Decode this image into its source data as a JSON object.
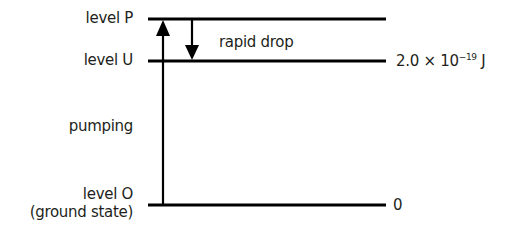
{
  "diagram": {
    "type": "energy-level-diagram",
    "levels": [
      {
        "id": "P",
        "label": "level P",
        "energy_label": ""
      },
      {
        "id": "U",
        "label": "level U",
        "energy_label": "2.0 × 10⁻¹⁹ J"
      },
      {
        "id": "O",
        "label": "level O",
        "sublabel": "(ground state)",
        "energy_label": "0"
      }
    ],
    "transitions": [
      {
        "from": "O",
        "to": "P",
        "label": "pumping",
        "direction": "up"
      },
      {
        "from": "P",
        "to": "U",
        "label": "rapid drop",
        "direction": "down"
      }
    ],
    "energy_U": {
      "mantissa": "2.0 × 10",
      "exponent": "−19",
      "unit": " J"
    },
    "energy_O": "0",
    "colors": {
      "line": "#000000",
      "text": "#231f20",
      "background": "#ffffff"
    }
  }
}
